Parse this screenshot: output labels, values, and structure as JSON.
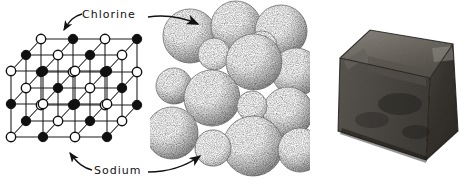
{
  "figure": {
    "background_color": "#ffffff",
    "ink_color": "#121212"
  },
  "labels": [
    {
      "id": "chlorine",
      "text": "Chlorine",
      "points_to": [
        "lattice-open-sphere",
        "packing-large-sphere"
      ],
      "arrow_left": true,
      "arrow_right": true
    },
    {
      "id": "sodium",
      "text": "Sodium",
      "points_to": [
        "lattice-filled-sphere",
        "packing-small-sphere"
      ],
      "arrow_left": true,
      "arrow_right": true
    }
  ],
  "panels": [
    {
      "id": "lattice",
      "name": "ball-and-stick-lattice",
      "caption": "",
      "kind": "line-diagram",
      "grid": 3,
      "node_types": [
        {
          "species": "Sodium",
          "fill": "#101010",
          "radius": 4.6
        },
        {
          "species": "Chlorine",
          "fill": "#ffffff",
          "stroke": "#101010",
          "radius": 4.6
        }
      ]
    },
    {
      "id": "packing",
      "name": "space-filling-sphere-model",
      "kind": "stipple-drawing",
      "large_sphere_species": "Chlorine",
      "small_sphere_species": "Sodium"
    },
    {
      "id": "photo",
      "name": "halite-crystal-photograph",
      "kind": "photograph",
      "subject": "salt crystal cube",
      "tones": {
        "top_face": "#6e6a64",
        "left_face": "#4a4743",
        "front_face": "#3a3733",
        "highlight": "#9a968e"
      }
    }
  ]
}
